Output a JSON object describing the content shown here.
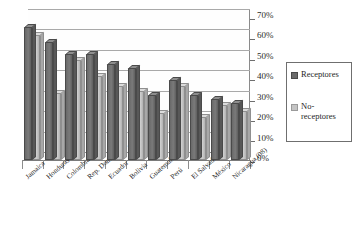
{
  "chart_data": {
    "type": "bar",
    "title": "",
    "subtitle": "",
    "xlabel": "",
    "ylabel": "",
    "ylim": [
      0,
      70
    ],
    "ytick_labels": [
      "0%",
      "10%",
      "20%",
      "30%",
      "40%",
      "50%",
      "60%",
      "70%"
    ],
    "ytick_values": [
      0,
      10,
      20,
      30,
      40,
      50,
      60,
      70
    ],
    "grid": true,
    "legend_position": "right",
    "categories": [
      "Jamaica",
      "Honduras (08)",
      "Colombia",
      "Rep. Dominicana",
      "Ecuador",
      "Bolivia",
      "Guatemala (07)",
      "Perú",
      "El Salvador",
      "México",
      "Nicaragua (08)"
    ],
    "series": [
      {
        "name": "Receptores",
        "color": "#6b6b6b",
        "values": [
          65,
          58,
          52,
          52,
          47,
          45,
          32,
          39,
          32,
          30,
          28
        ]
      },
      {
        "name": "No-receptores",
        "color": "#c4c4c4",
        "values": [
          61,
          33,
          49,
          41,
          36,
          34,
          23,
          36,
          21,
          27,
          24
        ]
      }
    ]
  },
  "legend": {
    "items": [
      {
        "label": "Receptores",
        "swatch": "dark"
      },
      {
        "label": "No-receptores",
        "swatch": "light"
      }
    ]
  }
}
